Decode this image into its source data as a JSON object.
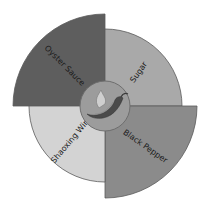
{
  "diagram": {
    "type": "radial-quadrant",
    "center": {
      "x": 105,
      "y": 106
    },
    "hub": {
      "radius": 25,
      "fill": "#9c9c9c",
      "stroke": "#6e6e6e",
      "icon": "chili-pepper-icon"
    },
    "sectors": [
      {
        "label": "Oyster Sauce",
        "quadrant": "top-left",
        "start_angle": 180,
        "end_angle": 270,
        "radius": 92,
        "fill": "#5e5e5e",
        "text_color": "#1a1a1a"
      },
      {
        "label": "Sugar",
        "quadrant": "top-right",
        "start_angle": 270,
        "end_angle": 360,
        "radius": 77,
        "fill": "#a9a9a9",
        "text_color": "#1a1a1a"
      },
      {
        "label": "Black Pepper",
        "quadrant": "bottom-right",
        "start_angle": 0,
        "end_angle": 90,
        "radius": 92,
        "fill": "#8b8b8b",
        "text_color": "#1a1a1a"
      },
      {
        "label": "Shaoxing Wine",
        "quadrant": "bottom-left",
        "start_angle": 90,
        "end_angle": 180,
        "radius": 76,
        "fill": "#d3d3d3",
        "text_color": "#1a1a1a"
      }
    ],
    "stroke_color": "#5a5a5a"
  }
}
